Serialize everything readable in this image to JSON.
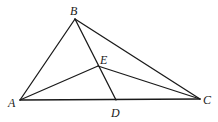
{
  "diagram": {
    "type": "geometry-triangle",
    "points": {
      "A": {
        "x": 20,
        "y": 100,
        "label": "A",
        "lx": 8,
        "ly": 107
      },
      "B": {
        "x": 75,
        "y": 19,
        "label": "B",
        "lx": 70,
        "ly": 15
      },
      "C": {
        "x": 200,
        "y": 99,
        "label": "C",
        "lx": 203,
        "ly": 104
      },
      "D": {
        "x": 116,
        "y": 100,
        "label": "D",
        "lx": 111,
        "ly": 117
      },
      "E": {
        "x": 98,
        "y": 66,
        "label": "E",
        "lx": 100,
        "ly": 64
      }
    },
    "segments": [
      [
        "A",
        "B"
      ],
      [
        "B",
        "C"
      ],
      [
        "A",
        "C"
      ],
      [
        "B",
        "D"
      ],
      [
        "A",
        "E"
      ],
      [
        "E",
        "C"
      ]
    ],
    "stroke_color": "#1a1a1a"
  }
}
